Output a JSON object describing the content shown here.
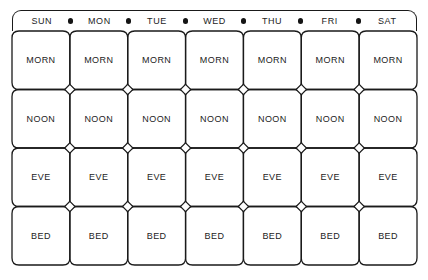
{
  "document": {
    "type": "medication-schedule-grid",
    "title": "Weekly medication times chart"
  },
  "header": {
    "days": [
      "SUN",
      "MON",
      "TUE",
      "WED",
      "THU",
      "FRI",
      "SAT"
    ],
    "separator_icon": "dot-separator",
    "separator_count": 6
  },
  "grid": {
    "columns": 7,
    "rows": 4,
    "row_labels": [
      "MORN",
      "NOON",
      "EVE",
      "BED"
    ],
    "junction_icon": "diamond-marker",
    "cells": [
      [
        "MORN",
        "MORN",
        "MORN",
        "MORN",
        "MORN",
        "MORN",
        "MORN"
      ],
      [
        "NOON",
        "NOON",
        "NOON",
        "NOON",
        "NOON",
        "NOON",
        "NOON"
      ],
      [
        "EVE",
        "EVE",
        "EVE",
        "EVE",
        "EVE",
        "EVE",
        "EVE"
      ],
      [
        "BED",
        "BED",
        "BED",
        "BED",
        "BED",
        "BED",
        "BED"
      ]
    ]
  },
  "colors": {
    "stroke": "#1a1a1a",
    "text": "#1c1c1c",
    "background": "#ffffff"
  }
}
